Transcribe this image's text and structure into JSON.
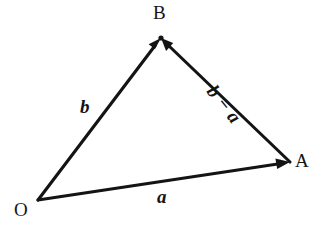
{
  "diagram": {
    "background_color": "#ffffff",
    "stroke_color": "#141414",
    "points": [
      {
        "id": "O",
        "label": "O",
        "x": 38,
        "y": 200
      },
      {
        "id": "B",
        "label": "B",
        "x": 161,
        "y": 38
      },
      {
        "id": "A",
        "label": "A",
        "x": 290,
        "y": 162
      }
    ],
    "vectors": [
      {
        "id": "OB",
        "label": "b",
        "from": "O",
        "to": "B",
        "arrowhead_at": "B",
        "label_x": 87,
        "label_y": 107,
        "label_rotation_deg": 0
      },
      {
        "id": "OA",
        "label": "a",
        "from": "O",
        "to": "A",
        "arrowhead_at": "A",
        "label_x": 165,
        "label_y": 197,
        "label_rotation_deg": 0
      },
      {
        "id": "AB",
        "label": "b − a",
        "from": "A",
        "to": "B",
        "arrowhead_at": "B",
        "label_x": 235,
        "label_y": 88,
        "label_rotation_deg": 51.5
      }
    ],
    "label_point_O": "O",
    "label_point_B": "B",
    "label_point_A": "A",
    "label_vector_b": "b",
    "label_vector_a": "a",
    "label_vector_b_minus_a": "b − a"
  }
}
